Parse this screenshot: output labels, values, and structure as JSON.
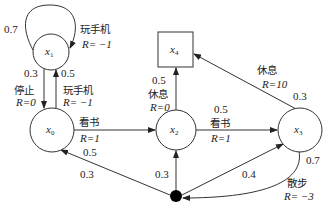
{
  "diagram": {
    "type": "markov-reward-process",
    "nodes": [
      {
        "id": "x0",
        "var": "x",
        "sub": "0",
        "shape": "circle"
      },
      {
        "id": "x1",
        "var": "x",
        "sub": "1",
        "shape": "circle"
      },
      {
        "id": "x2",
        "var": "x",
        "sub": "2",
        "shape": "circle"
      },
      {
        "id": "x3",
        "var": "x",
        "sub": "3",
        "shape": "circle"
      },
      {
        "id": "x4",
        "var": "x",
        "sub": "4",
        "shape": "square"
      },
      {
        "id": "dot",
        "shape": "filled-circle"
      }
    ],
    "edges": {
      "x1_self": {
        "prob": "0.7",
        "action": "玩手机",
        "reward": "R= −1"
      },
      "x1_x0": {
        "prob": "0.3",
        "action": "停止",
        "reward": "R=0"
      },
      "x0_x1": {
        "prob": "0.5",
        "action": "玩手机",
        "reward": "R= −1"
      },
      "x0_x2": {
        "action": "看书",
        "reward": "R=1"
      },
      "x0_dot": {
        "prob": "0.5"
      },
      "dot_x0": {
        "prob": "0.3"
      },
      "x2_x4": {
        "prob": "0.5",
        "action": "休息",
        "reward": "R=0"
      },
      "x2_x3": {
        "prob": "0.5",
        "action": "看书",
        "reward": "R=1"
      },
      "dot_x2": {
        "prob": "0.3"
      },
      "dot_x3": {
        "prob": "0.4"
      },
      "x3_x4": {
        "prob": "0.3",
        "action": "休息",
        "reward": "R=10"
      },
      "x3_dot": {
        "prob": "0.7",
        "action": "散步",
        "reward": "R= −3"
      }
    }
  }
}
